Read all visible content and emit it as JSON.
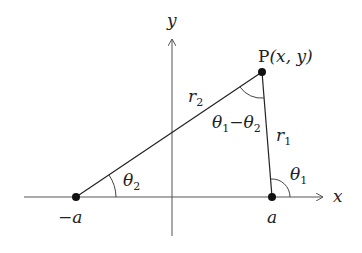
{
  "diagram": {
    "colors": {
      "line": "#222222",
      "axis": "#555555",
      "point": "#111111",
      "background": "#ffffff"
    },
    "axes": {
      "x_label": "x",
      "y_label": "y"
    },
    "points": {
      "neg_a": {
        "label": "−a"
      },
      "a": {
        "label": "a"
      },
      "P": {
        "label_prefix": "P",
        "label_coords": "(x, y)"
      }
    },
    "segments": {
      "r1": {
        "symbol": "r",
        "subscript": "1"
      },
      "r2": {
        "symbol": "r",
        "subscript": "2"
      }
    },
    "angles": {
      "theta1": {
        "symbol": "θ",
        "subscript": "1"
      },
      "theta2": {
        "symbol": "θ",
        "subscript": "2"
      },
      "theta_diff": {
        "symbol_a": "θ",
        "sub_a": "1",
        "minus": "−",
        "symbol_b": "θ",
        "sub_b": "2"
      }
    }
  }
}
